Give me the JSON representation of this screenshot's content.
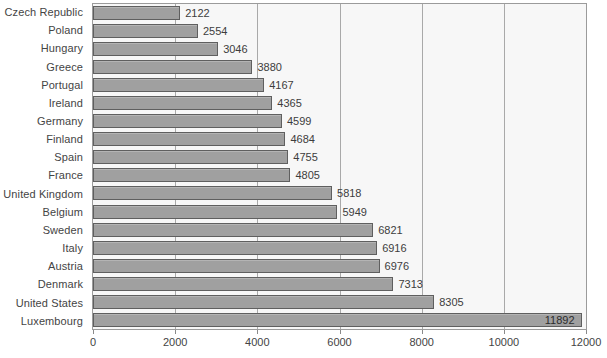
{
  "chart_data": {
    "type": "bar",
    "orientation": "horizontal",
    "title": "",
    "subtitle": "",
    "xlabel": "",
    "ylabel": "",
    "xlim": [
      0,
      12000
    ],
    "xticks": [
      0,
      2000,
      4000,
      6000,
      8000,
      10000,
      12000
    ],
    "xtick_labels": [
      "0",
      "2000",
      "4000",
      "6000",
      "8000",
      "10000",
      "12000"
    ],
    "grid": true,
    "grid_axis": "x",
    "legend": false,
    "legend_position": "none",
    "categories": [
      "Czech Republic",
      "Poland",
      "Hungary",
      "Greece",
      "Portugal",
      "Ireland",
      "Germany",
      "Finland",
      "Spain",
      "France",
      "United Kingdom",
      "Belgium",
      "Sweden",
      "Italy",
      "Austria",
      "Denmark",
      "United States",
      "Luxembourg"
    ],
    "values": [
      2122,
      2554,
      3046,
      3880,
      4167,
      4365,
      4599,
      4684,
      4755,
      4805,
      5818,
      5949,
      6821,
      6916,
      6976,
      7313,
      8305,
      11892
    ],
    "data_labels": [
      "2122",
      "2554",
      "3046",
      "3880",
      "4167",
      "4365",
      "4599",
      "4684",
      "4755",
      "4805",
      "5818",
      "5949",
      "6821",
      "6916",
      "6976",
      "7313",
      "8305",
      "11892"
    ],
    "label_placement": [
      "outside",
      "outside",
      "outside",
      "outside",
      "outside",
      "outside",
      "outside",
      "outside",
      "outside",
      "outside",
      "outside",
      "outside",
      "outside",
      "outside",
      "outside",
      "outside",
      "outside",
      "inside"
    ],
    "colors": {
      "bar_fill": "#a0a0a0",
      "bar_border": "#5f5f5f",
      "plot_background": "#f7f7f7",
      "plot_border": "#9b9b9b",
      "gridline": "#a9a9a9",
      "text": "#3d3d3d",
      "page_background": "#ffffff"
    }
  }
}
